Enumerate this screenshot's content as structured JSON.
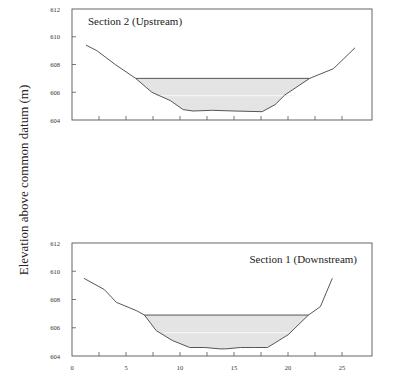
{
  "figure": {
    "ylabel": "Elevation above common datum (m)"
  },
  "chart_data": [
    {
      "type": "area",
      "title": "Section 2 (Upstream)",
      "xlabel": "",
      "ylabel": "Elevation above common datum (m)",
      "xlim": [
        0,
        28
      ],
      "ylim": [
        604,
        612
      ],
      "yticks": [
        604,
        606,
        608,
        610,
        612
      ],
      "yticklabels": [
        "604",
        "606",
        "608",
        "610",
        "612"
      ],
      "xticks": [
        2.5,
        5,
        7.5,
        10,
        12.5,
        15,
        17.5,
        20,
        22.5,
        25
      ],
      "xticklabels": [],
      "grid": false,
      "water_surface": 607.0,
      "series": [
        {
          "name": "Bed profile",
          "x": [
            1.3,
            2.3,
            4.0,
            5.9,
            7.4,
            9.1,
            10.3,
            11.2,
            13.0,
            15.0,
            17.6,
            18.8,
            19.7,
            22.0,
            24.2,
            26.2
          ],
          "y": [
            609.4,
            609.0,
            608.0,
            607.0,
            606.0,
            605.4,
            604.75,
            604.65,
            604.7,
            604.65,
            604.6,
            605.1,
            605.8,
            607.0,
            607.7,
            609.2
          ]
        }
      ]
    },
    {
      "type": "area",
      "title": "Section 1 (Downstream)",
      "xlabel": "",
      "ylabel": "Elevation above common datum (m)",
      "xlim": [
        0,
        28
      ],
      "ylim": [
        604,
        612
      ],
      "yticks": [
        604,
        606,
        608,
        610,
        612
      ],
      "yticklabels": [
        "604",
        "606",
        "608",
        "610",
        "612"
      ],
      "xticks": [
        0,
        2.5,
        5,
        7.5,
        10,
        12.5,
        15,
        17.5,
        20,
        22.5,
        25
      ],
      "xticklabels": [
        "0",
        "",
        "5",
        "",
        "10",
        "",
        "15",
        "",
        "20",
        "",
        "25"
      ],
      "grid": false,
      "water_surface": 606.9,
      "series": [
        {
          "name": "Bed profile",
          "x": [
            1.1,
            3.0,
            4.1,
            6.0,
            6.7,
            7.8,
            9.3,
            10.9,
            12.3,
            13.7,
            14.2,
            15.6,
            16.9,
            18.1,
            20.0,
            21.9,
            23.0,
            24.1
          ],
          "y": [
            609.5,
            608.7,
            607.8,
            607.2,
            606.9,
            605.8,
            605.1,
            604.6,
            604.6,
            604.5,
            604.5,
            604.6,
            604.6,
            604.6,
            605.5,
            606.9,
            607.5,
            609.5
          ]
        }
      ]
    }
  ],
  "colors": {
    "axis": "#555555",
    "line": "#444444",
    "fill": "#e4e4e4"
  }
}
